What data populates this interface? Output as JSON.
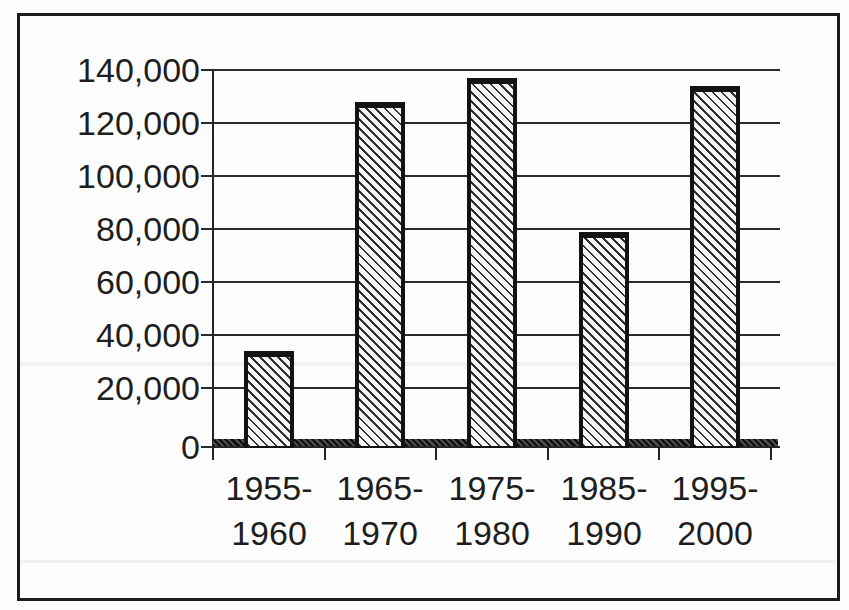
{
  "chart_data": {
    "type": "bar",
    "title": "",
    "xlabel": "",
    "ylabel": "",
    "categories": [
      "1955-1960",
      "1965-1970",
      "1975-1980",
      "1985-1990",
      "1995-2000"
    ],
    "values": [
      34000,
      128000,
      137000,
      79000,
      134000
    ],
    "ylim": [
      0,
      140000
    ],
    "ytick_step": 20000,
    "yticks": [
      {
        "value": 140000,
        "label": "140,000"
      },
      {
        "value": 120000,
        "label": "120,000"
      },
      {
        "value": 100000,
        "label": "100,000"
      },
      {
        "value": 80000,
        "label": "80,000"
      },
      {
        "value": 60000,
        "label": "60,000"
      },
      {
        "value": 40000,
        "label": "40,000"
      },
      {
        "value": 20000,
        "label": "20,000"
      },
      {
        "value": 0,
        "label": "0"
      }
    ],
    "grid": true,
    "legend": "none",
    "style": {
      "bar_fill": "#f6f6f6",
      "bar_hatch": "diagonal-backslash",
      "bar_hatch_color": "#161616",
      "bar_border_color": "#131313",
      "axis_color": "#242424",
      "gridline_color": "#2b2b2b",
      "text_color": "#1e1e1e",
      "frame_border_color": "#1c1c1c",
      "background": "#fdfdfd"
    }
  }
}
